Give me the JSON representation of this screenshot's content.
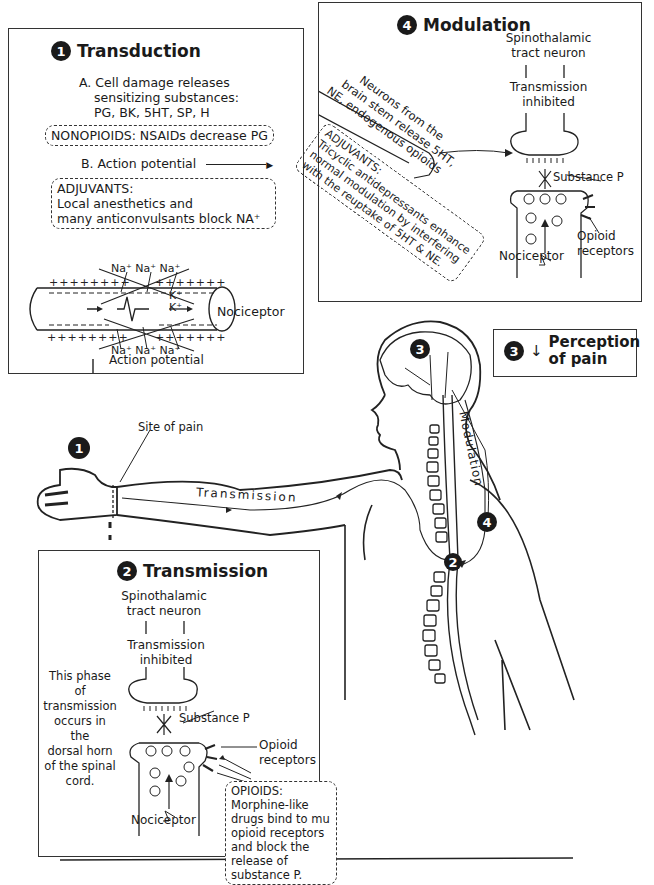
{
  "transduction": {
    "number": "1",
    "title": "Transduction",
    "step_a": [
      "A. Cell damage releases",
      "sensitizing substances:",
      "PG, BK, 5HT, SP, H"
    ],
    "nonopioids": "NONOPIOIDS: NSAIDs decrease PG",
    "step_b": "B. Action potential",
    "adjuvants": [
      "ADJUVANTS:",
      "Local anesthetics and",
      "many anticonvulsants block NA⁺"
    ],
    "ions_top": "Na⁺ Na⁺ Na⁺",
    "ions_bottom": "Na⁺ Na⁺ Na⁺",
    "k_ions": [
      "K⁺",
      "K⁺"
    ],
    "nociceptor_label": "Nociceptor",
    "action_potential_label": "Action potential"
  },
  "modulation": {
    "number": "4",
    "title": "Modulation",
    "neuron_label": [
      "Spinothalamic",
      "tract neuron"
    ],
    "inhibited_label": [
      "Transmission",
      "inhibited"
    ],
    "brainstem_note": [
      "Neurons from the",
      "brain stem release 5HT,",
      "NE, endogenous opioids"
    ],
    "adjuvants_note": [
      "ADJUVANTS:",
      "Tricyclic antidepressants enhance",
      "normal modulation by interfering",
      "with the reuptake of 5HT & NE."
    ],
    "substance_p": "Substance P",
    "opioid_receptors": [
      "Opioid",
      "receptors"
    ],
    "nociceptor_label": "Nociceptor"
  },
  "perception": {
    "number": "3",
    "arrow": "↓",
    "title": [
      "Perception",
      "of pain"
    ]
  },
  "body_figure": {
    "site_of_pain": "Site of pain",
    "transmission_label": "Transmission",
    "modulation_label": "Modulation",
    "markers": [
      "1",
      "2",
      "3",
      "4"
    ]
  },
  "transmission": {
    "number": "2",
    "title": "Transmission",
    "neuron_label": [
      "Spinothalamic",
      "tract neuron"
    ],
    "inhibited_label": [
      "Transmission",
      "inhibited"
    ],
    "phase_note": [
      "This phase of",
      "transmission",
      "occurs in the",
      "dorsal horn",
      "of the spinal",
      "cord."
    ],
    "substance_p": "Substance P",
    "opioid_receptors": [
      "Opioid",
      "receptors"
    ],
    "opioids_note": [
      "OPIOIDS:",
      "Morphine-like",
      "drugs bind to mu",
      "opioid receptors",
      "and block the",
      "release of",
      "substance P."
    ],
    "nociceptor_label": "Nociceptor"
  }
}
